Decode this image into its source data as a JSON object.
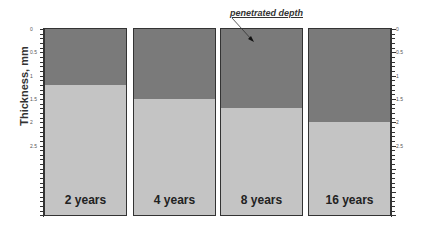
{
  "chart_data": {
    "type": "bar",
    "title": "",
    "ylabel": "Thickness, mm",
    "xlabel": "",
    "ylim": [
      0,
      4.0
    ],
    "y_inverted": true,
    "y_ticks": [
      "0",
      "0.5",
      "1",
      "1.5",
      "2",
      "2.5"
    ],
    "categories": [
      "2 years",
      "4 years",
      "8 years",
      "16 years"
    ],
    "series": [
      {
        "name": "penetrated depth",
        "values": [
          1.2,
          1.5,
          1.7,
          2.0
        ],
        "color": "#7a7a7a"
      },
      {
        "name": "remaining thickness",
        "values": [
          2.8,
          2.5,
          2.3,
          2.0
        ],
        "color": "#c4c4c4"
      }
    ],
    "annotations": [
      {
        "text": "penetrated depth",
        "target": "8 years"
      }
    ],
    "grid": false,
    "legend": "none"
  },
  "labels": {
    "ylabel": "Thickness, mm",
    "annotation": "penetrated depth"
  }
}
